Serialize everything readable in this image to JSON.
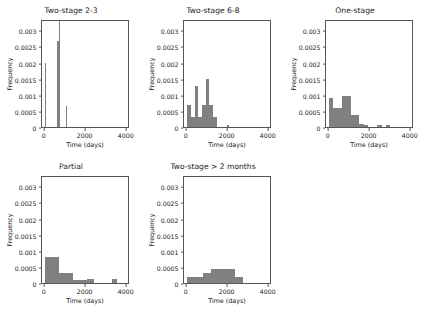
{
  "figure": {
    "background": "#ffffff",
    "bar_color": "#808080",
    "axis_color": "#555555",
    "rows": 2,
    "cols": 3,
    "empty_cells": [
      "row2-col3"
    ]
  },
  "axis_defaults": {
    "xlabel": "Time (days)",
    "ylabel": "Frequency",
    "xticks": [
      "0",
      "2000",
      "4000"
    ],
    "xtick_values": [
      0,
      2000,
      4000
    ],
    "xlim": [
      -130,
      4160
    ],
    "yticks": [
      "0.0000",
      "0.0005",
      "0.0010",
      "0.0015",
      "0.0020",
      "0.0025",
      "0.0030"
    ],
    "ytick_values": [
      0.0,
      0.0005,
      0.001,
      0.0015,
      0.002,
      0.0025,
      0.003
    ],
    "ylim": [
      0,
      0.00335
    ],
    "grid": false,
    "legend": null
  },
  "chart_data": [
    {
      "id": "two-stage-2-3",
      "type": "bar",
      "title": "Two-stage 2-3",
      "xlabel": "Time (days)",
      "ylabel": "Frequency",
      "xlim": [
        -130,
        4160
      ],
      "ylim": [
        0,
        0.00335
      ],
      "xticks": [
        0,
        2000,
        4000
      ],
      "yticks": [
        0.0,
        0.0005,
        0.001,
        0.0015,
        0.002,
        0.0025,
        0.003
      ],
      "bin_edges": [
        0,
        100,
        600,
        700,
        800,
        1050,
        1150
      ],
      "bars": [
        {
          "x0": 20,
          "x1": 90,
          "height": 0.002
        },
        {
          "x0": 620,
          "x1": 680,
          "height": 0.00268
        },
        {
          "x0": 680,
          "x1": 740,
          "height": 0.00332
        },
        {
          "x0": 1050,
          "x1": 1095,
          "height": 0.00065
        }
      ]
    },
    {
      "id": "two-stage-6-8",
      "type": "bar",
      "title": "Two-stage 6-8",
      "xlabel": "Time (days)",
      "ylabel": "Frequency",
      "xlim": [
        -130,
        4160
      ],
      "ylim": [
        0,
        0.00335
      ],
      "xticks": [
        0,
        2000,
        4000
      ],
      "yticks": [
        0.0,
        0.0005,
        0.001,
        0.0015,
        0.002,
        0.0025,
        0.003
      ],
      "bars": [
        {
          "x0": 30,
          "x1": 210,
          "height": 0.00068
        },
        {
          "x0": 210,
          "x1": 390,
          "height": 0.0003
        },
        {
          "x0": 390,
          "x1": 570,
          "height": 0.00128
        },
        {
          "x0": 570,
          "x1": 750,
          "height": 0.0003
        },
        {
          "x0": 750,
          "x1": 930,
          "height": 0.00068
        },
        {
          "x0": 930,
          "x1": 1110,
          "height": 0.00148
        },
        {
          "x0": 1110,
          "x1": 1290,
          "height": 0.00068
        },
        {
          "x0": 1290,
          "x1": 1470,
          "height": 0.0003
        },
        {
          "x0": 1950,
          "x1": 2060,
          "height": 6e-05
        }
      ]
    },
    {
      "id": "one-stage",
      "type": "bar",
      "title": "One-stage",
      "xlabel": "Time (days)",
      "ylabel": "Frequency",
      "xlim": [
        -130,
        4160
      ],
      "ylim": [
        0,
        0.00335
      ],
      "xticks": [
        0,
        2000,
        4000
      ],
      "yticks": [
        0.0,
        0.0005,
        0.001,
        0.0015,
        0.002,
        0.0025,
        0.003
      ],
      "bars": [
        {
          "x0": 20,
          "x1": 230,
          "height": 0.0009
        },
        {
          "x0": 230,
          "x1": 440,
          "height": 0.00058
        },
        {
          "x0": 440,
          "x1": 650,
          "height": 0.00058
        },
        {
          "x0": 650,
          "x1": 860,
          "height": 0.00097
        },
        {
          "x0": 860,
          "x1": 1070,
          "height": 0.00097
        },
        {
          "x0": 1070,
          "x1": 1280,
          "height": 0.00038
        },
        {
          "x0": 1280,
          "x1": 1490,
          "height": 0.00038
        },
        {
          "x0": 1490,
          "x1": 1700,
          "height": 0.0001
        },
        {
          "x0": 1700,
          "x1": 1910,
          "height": 6e-05
        },
        {
          "x0": 2380,
          "x1": 2590,
          "height": 6e-05
        },
        {
          "x0": 2800,
          "x1": 3010,
          "height": 6e-05
        }
      ]
    },
    {
      "id": "partial",
      "type": "bar",
      "title": "Partial",
      "xlabel": "Time (days)",
      "ylabel": "Frequency",
      "xlim": [
        -130,
        4160
      ],
      "ylim": [
        0,
        0.00335
      ],
      "xticks": [
        0,
        2000,
        4000
      ],
      "yticks": [
        0.0,
        0.0005,
        0.001,
        0.0015,
        0.002,
        0.0025,
        0.003
      ],
      "bars": [
        {
          "x0": 30,
          "x1": 700,
          "height": 0.00082
        },
        {
          "x0": 700,
          "x1": 1380,
          "height": 0.00032
        },
        {
          "x0": 1380,
          "x1": 2050,
          "height": 0.0001
        },
        {
          "x0": 2050,
          "x1": 2400,
          "height": 0.00012
        },
        {
          "x0": 3270,
          "x1": 3520,
          "height": 0.00012
        }
      ]
    },
    {
      "id": "two-stage-gt-2-months",
      "type": "bar",
      "title": "Two-stage > 2 months",
      "xlabel": "Time (days)",
      "ylabel": "Frequency",
      "xlim": [
        -130,
        4160
      ],
      "ylim": [
        0,
        0.00335
      ],
      "xticks": [
        0,
        2000,
        4000
      ],
      "yticks": [
        0.0,
        0.0005,
        0.001,
        0.0015,
        0.002,
        0.0025,
        0.003
      ],
      "bars": [
        {
          "x0": 40,
          "x1": 430,
          "height": 0.0002
        },
        {
          "x0": 430,
          "x1": 820,
          "height": 0.0002
        },
        {
          "x0": 820,
          "x1": 1210,
          "height": 0.00032
        },
        {
          "x0": 1210,
          "x1": 1600,
          "height": 0.00042
        },
        {
          "x0": 1600,
          "x1": 1990,
          "height": 0.00044
        },
        {
          "x0": 1990,
          "x1": 2380,
          "height": 0.00042
        },
        {
          "x0": 2380,
          "x1": 2770,
          "height": 0.0002
        }
      ]
    }
  ]
}
